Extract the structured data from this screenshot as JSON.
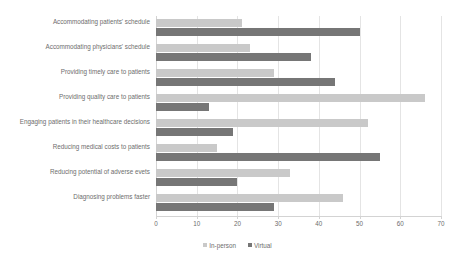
{
  "chart_data": {
    "type": "bar",
    "orientation": "horizontal",
    "title": "",
    "xlabel": "",
    "ylabel": "",
    "xlim": [
      0,
      70
    ],
    "xticks": [
      0,
      10,
      20,
      30,
      40,
      50,
      60,
      70
    ],
    "grid": true,
    "legend_position": "bottom",
    "categories": [
      "Accommodating patients' schedule",
      "Accommodating physicians' schedule",
      "Providing timely care to patients",
      "Providing quality care to patients",
      "Engaging patients in their healthcare decisions",
      "Reducing medical costs to patients",
      "Reducing potential of adverse evets",
      "Diagnosing problems faster"
    ],
    "series": [
      {
        "name": "In-person",
        "color": "#c9c9c9",
        "values": [
          21,
          23,
          29,
          66,
          52,
          15,
          33,
          46
        ]
      },
      {
        "name": "Virtual",
        "color": "#767676",
        "values": [
          50,
          38,
          44,
          13,
          19,
          55,
          20,
          29
        ]
      }
    ]
  },
  "axis": {
    "tick_labels": [
      "0",
      "10",
      "20",
      "30",
      "40",
      "50",
      "60",
      "70"
    ]
  },
  "legend": {
    "items": [
      {
        "label": "In-person",
        "color": "#c9c9c9"
      },
      {
        "label": "Virtual",
        "color": "#767676"
      }
    ]
  },
  "colors": {
    "in_person": "#c9c9c9",
    "virtual": "#767676",
    "grid": "#e4e4e4",
    "text": "#6d6d6d",
    "background": "#ffffff"
  }
}
